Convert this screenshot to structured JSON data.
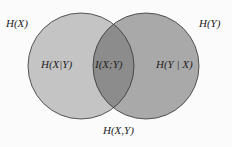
{
  "diagram": {
    "type": "venn",
    "labels": {
      "hx": "H(X)",
      "hy": "H(Y)",
      "hx_given_y": "H(X|Y)",
      "mutual_info": "I(X;Y)",
      "hy_given_x": "H(Y | X)",
      "joint": "H(X,Y)"
    },
    "colors": {
      "left_circle": "#c4c4c4",
      "right_circle": "#a9a9a9",
      "intersection": "#8c8c8c",
      "stroke": "#333333"
    }
  }
}
